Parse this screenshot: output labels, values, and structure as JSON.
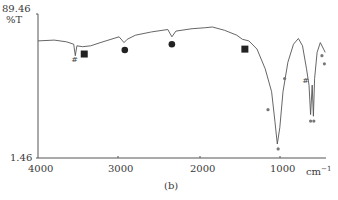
{
  "chart_data": {
    "type": "line",
    "title": "",
    "caption": "(b)",
    "xlabel": "cm⁻¹",
    "ylabel": "%T",
    "xlim": [
      4000,
      450
    ],
    "ylim": [
      1.46,
      89.46
    ],
    "x_reversed": true,
    "x_ticks": [
      4000,
      3000,
      2000,
      1000
    ],
    "y_ticks": [
      1.46,
      89.46
    ],
    "grid": false,
    "legend": null,
    "series": [
      {
        "name": "IR spectrum",
        "points": [
          [
            4000,
            73
          ],
          [
            3800,
            73.5
          ],
          [
            3650,
            72.5
          ],
          [
            3560,
            71
          ],
          [
            3540,
            64
          ],
          [
            3520,
            70
          ],
          [
            3450,
            69.5
          ],
          [
            3350,
            70
          ],
          [
            3200,
            72.5
          ],
          [
            3000,
            75.5
          ],
          [
            2940,
            72
          ],
          [
            2900,
            74
          ],
          [
            2800,
            76.5
          ],
          [
            2600,
            78.5
          ],
          [
            2400,
            80
          ],
          [
            2350,
            75.5
          ],
          [
            2300,
            79
          ],
          [
            2100,
            80.5
          ],
          [
            1950,
            81
          ],
          [
            1850,
            81.5
          ],
          [
            1700,
            79.5
          ],
          [
            1550,
            76.5
          ],
          [
            1480,
            74
          ],
          [
            1400,
            73
          ],
          [
            1300,
            68
          ],
          [
            1200,
            56
          ],
          [
            1120,
            42
          ],
          [
            1080,
            24
          ],
          [
            1050,
            10
          ],
          [
            1020,
            20
          ],
          [
            980,
            42
          ],
          [
            920,
            60
          ],
          [
            850,
            71
          ],
          [
            790,
            74.5
          ],
          [
            740,
            70
          ],
          [
            690,
            56
          ],
          [
            660,
            46
          ],
          [
            640,
            28
          ],
          [
            620,
            46
          ],
          [
            605,
            27
          ],
          [
            590,
            50
          ],
          [
            560,
            66
          ],
          [
            520,
            72
          ],
          [
            480,
            68
          ],
          [
            460,
            66
          ]
        ]
      }
    ],
    "annotations": [
      {
        "symbol": "#",
        "x": 3550,
        "y": 62
      },
      {
        "symbol": "square",
        "x": 3430,
        "y": 65
      },
      {
        "symbol": "circle",
        "x": 2930,
        "y": 67.5
      },
      {
        "symbol": "circle",
        "x": 2350,
        "y": 71
      },
      {
        "symbol": "square",
        "x": 1450,
        "y": 68
      },
      {
        "symbol": "dot",
        "x": 1165,
        "y": 31
      },
      {
        "symbol": "dot",
        "x": 1040,
        "y": 7
      },
      {
        "symbol": "dot",
        "x": 960,
        "y": 50
      },
      {
        "symbol": "#",
        "x": 700,
        "y": 49
      },
      {
        "symbol": "dot",
        "x": 640,
        "y": 24
      },
      {
        "symbol": "dot",
        "x": 600,
        "y": 24
      },
      {
        "symbol": "dot",
        "x": 500,
        "y": 64
      },
      {
        "symbol": "dot",
        "x": 470,
        "y": 59
      }
    ]
  },
  "labels": {
    "y_top": "89.46",
    "y_unit": "%T",
    "y_bottom": "1.46",
    "x_ticks": [
      "4000",
      "3000",
      "2000",
      "1000"
    ],
    "x_unit": "cm",
    "x_unit_exp": "−1",
    "caption": "(b)"
  }
}
